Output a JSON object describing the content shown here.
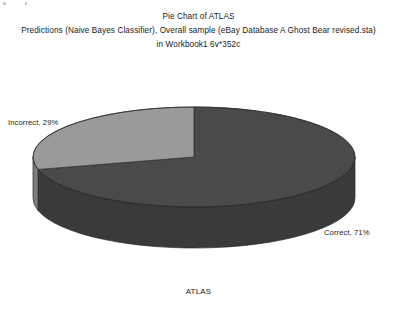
{
  "chart_data": {
    "type": "pie",
    "title": "Pie Chart of ATLAS",
    "title_line2": "Predictions (Naive Bayes Classifier), Overall sample (eBay Database A Ghost Bear revised.sta)",
    "title_line3": "in Workbook1 6v*352c",
    "xlabel": "ATLAS",
    "ylabel": "",
    "categories": [
      "Correct",
      "Incorrect"
    ],
    "values": [
      71,
      29
    ],
    "labels": [
      "Correct, 71%",
      "Incorrect, 29%"
    ],
    "unit": "%",
    "legend": "none",
    "grid": false,
    "three_d": true,
    "colors": {
      "correct_top": "#4a4a4a",
      "correct_side": "#3a3a3a",
      "incorrect_top": "#9a9a9a",
      "incorrect_side": "#7d7d7d",
      "outline": "#2a2a2a",
      "text": "#1a1a1a",
      "background": "#ffffff"
    },
    "geometry": {
      "center_x": 194,
      "center_y": 157,
      "radius_x": 161,
      "radius_y": 50,
      "depth": 41,
      "start_angle_deg": -90
    }
  },
  "labels": {
    "incorrect": "Incorrect, 29%",
    "correct": "Correct, 71%",
    "axis": "ATLAS"
  }
}
